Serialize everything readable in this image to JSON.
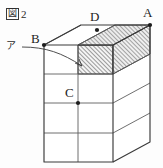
{
  "figure": {
    "label_glyph": "図",
    "label_number": "2",
    "caption_full": "図2"
  },
  "vertices": [
    {
      "id": "D",
      "label": "D",
      "x": 97,
      "y": 30,
      "label_x": 90,
      "label_y": 10
    },
    {
      "id": "A",
      "label": "A",
      "x": 150,
      "y": 25,
      "label_x": 143,
      "label_y": 6
    },
    {
      "id": "B",
      "label": "B",
      "x": 44,
      "y": 45,
      "label_x": 31,
      "label_y": 32
    },
    {
      "id": "C",
      "label": "C",
      "x": 78,
      "y": 103,
      "label_x": 65,
      "label_y": 86
    }
  ],
  "annotations": [
    {
      "id": "a-region",
      "label": "ア",
      "label_x": 6,
      "label_y": 45,
      "target_x": 82,
      "target_y": 64
    }
  ],
  "shading": {
    "region_name": "hatched-cube",
    "pattern": "diagonal-hatch",
    "hatch_color": "#4a4a4a",
    "fill_color": "#f2f2f2"
  },
  "geometry": {
    "front_face_columns": 2,
    "front_face_rows": 4,
    "side_face_rows": 4,
    "top_face_columns": 2,
    "line_color": "#5a5a5a",
    "heavy_line_color": "#3a3a3a",
    "background": "#fdfdfd"
  }
}
